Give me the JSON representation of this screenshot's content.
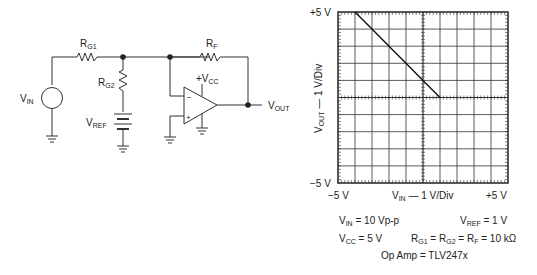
{
  "schematic": {
    "labels": {
      "rg1": {
        "main": "R",
        "sub": "G1"
      },
      "rg2": {
        "main": "R",
        "sub": "G2"
      },
      "rf": {
        "main": "R",
        "sub": "F"
      },
      "vin": {
        "main": "V",
        "sub": "IN"
      },
      "vref": {
        "main": "V",
        "sub": "REF"
      },
      "vcc": {
        "main": "+V",
        "sub": "CC"
      },
      "vout": {
        "main": "V",
        "sub": "OUT"
      },
      "minus": "−",
      "plus": "+"
    }
  },
  "chart_data": {
    "type": "line",
    "title": "",
    "xlabel": "V_IN — 1 V/Div",
    "ylabel": "V_OUT — 1 V/Div",
    "xlim": [
      -5,
      5
    ],
    "ylim": [
      -5,
      5
    ],
    "x_tick_labels": [
      "-5 V",
      "+5 V"
    ],
    "y_tick_labels": [
      "+5 V",
      "-5 V"
    ],
    "grid": true,
    "divisions": 10,
    "series": [
      {
        "name": "V_OUT",
        "x": [
          -4,
          -3,
          -2,
          -1,
          0,
          1
        ],
        "y": [
          5,
          4,
          3,
          2,
          1,
          0
        ]
      }
    ]
  },
  "axis": {
    "y_top": "+5 V",
    "y_bottom": "−5 V",
    "x_left": "−5 V",
    "x_right": "+5 V",
    "x_label_main": "V",
    "x_label_sub": "IN",
    "x_label_rest": " — 1 V/Div",
    "y_label_main": "V",
    "y_label_sub": "OUT",
    "y_label_rest": " — 1 V/Div"
  },
  "conditions": {
    "vin": {
      "main": "V",
      "sub": "IN",
      "rest": " = 10 Vp-p"
    },
    "vref": {
      "main": "V",
      "sub": "REF",
      "rest": " = 1 V"
    },
    "vcc": {
      "main": "V",
      "sub": "CC",
      "rest": " = 5 V"
    },
    "res": {
      "a": "R",
      "a_sub": "G1",
      "b": " = R",
      "b_sub": "G2",
      "c": " = R",
      "c_sub": "F",
      "rest": " = 10 kΩ"
    },
    "opamp": "Op Amp = TLV247x"
  }
}
